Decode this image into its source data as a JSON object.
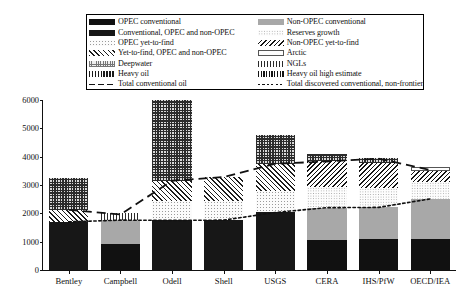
{
  "legend": {
    "left_column": [
      {
        "label": "OPEC conventional",
        "pattern": "p-opecconv"
      },
      {
        "label": "Conventional, OPEC and non-OPEC",
        "pattern": "p-convboth"
      },
      {
        "label": "OPEC yet-to-find",
        "pattern": "p-opecytf"
      },
      {
        "label": "Yet-to-find, OPEC and non-OPEC",
        "pattern": "p-ytfboth"
      },
      {
        "label": "Deepwater",
        "pattern": "p-deepwater"
      },
      {
        "label": "Heavy oil",
        "pattern": "p-heavyoil"
      },
      {
        "label": "Total conventional oil",
        "pattern": "sw-dash"
      }
    ],
    "right_column": [
      {
        "label": "Non-OPEC conventional",
        "pattern": "p-nonopecconv"
      },
      {
        "label": "Reserves growth",
        "pattern": "p-resgrowth"
      },
      {
        "label": "Non-OPEC yet-to-find",
        "pattern": "p-nonopecytf"
      },
      {
        "label": "Arctic",
        "pattern": "p-arctic"
      },
      {
        "label": "NGLs",
        "pattern": "p-ngls"
      },
      {
        "label": "Heavy oil high estimate",
        "pattern": "p-heavyhigh"
      },
      {
        "label": "Total discovered conventional, non-frontier",
        "pattern": "sw-dot"
      }
    ]
  },
  "chart_data": {
    "type": "bar",
    "title": "",
    "xlabel": "",
    "ylabel": "",
    "ylim": [
      0,
      6000
    ],
    "yticks": [
      0,
      1000,
      2000,
      3000,
      4000,
      5000,
      6000
    ],
    "grid": false,
    "stacked": true,
    "legend_position": "top",
    "categories": [
      "Bentley",
      "Campbell",
      "Odell",
      "Shell",
      "USGS",
      "CERA",
      "IHS/PfW",
      "OECD/IEA"
    ],
    "totals": [
      3230,
      2020,
      6000,
      3280,
      4750,
      4100,
      3950,
      3650
    ],
    "series": [
      {
        "name": "Conventional, OPEC and non-OPEC",
        "pattern": "p-convboth",
        "values": [
          1700,
          0,
          1750,
          1760,
          2030,
          0,
          0,
          0
        ]
      },
      {
        "name": "OPEC conventional",
        "pattern": "p-opecconv",
        "values": [
          0,
          930,
          0,
          0,
          0,
          1070,
          1080,
          1090
        ]
      },
      {
        "name": "Non-OPEC conventional",
        "pattern": "p-nonopecconv",
        "values": [
          0,
          830,
          0,
          0,
          0,
          1130,
          1130,
          1420
        ]
      },
      {
        "name": "OPEC yet-to-find",
        "pattern": "p-opecytf",
        "values": [
          0,
          0,
          700,
          680,
          760,
          0,
          0,
          0
        ]
      },
      {
        "name": "Reserves growth",
        "pattern": "p-resgrowth",
        "values": [
          0,
          0,
          0,
          0,
          0,
          730,
          700,
          600
        ]
      },
      {
        "name": "Yet-to-find, OPEC and non-OPEC",
        "pattern": "p-ytfboth",
        "values": [
          420,
          0,
          700,
          840,
          960,
          0,
          0,
          0
        ]
      },
      {
        "name": "Non-OPEC yet-to-find",
        "pattern": "p-nonopecytf",
        "values": [
          0,
          0,
          0,
          0,
          0,
          930,
          860,
          400
        ]
      },
      {
        "name": "Arctic",
        "pattern": "p-arctic",
        "values": [
          0,
          0,
          0,
          0,
          0,
          0,
          0,
          140
        ]
      },
      {
        "name": "NGLs",
        "pattern": "p-ngls",
        "values": [
          0,
          260,
          0,
          0,
          0,
          0,
          0,
          0
        ]
      },
      {
        "name": "Deepwater / other unconventional",
        "pattern": "p-checkdark",
        "values": [
          1110,
          0,
          2850,
          0,
          1000,
          240,
          180,
          0
        ]
      }
    ],
    "lines": [
      {
        "name": "Total conventional oil",
        "style": "dashed",
        "values": [
          2120,
          1960,
          3150,
          3280,
          3750,
          3830,
          3930,
          3530
        ]
      },
      {
        "name": "Total discovered conventional, non-frontier",
        "style": "dotted",
        "values": [
          1700,
          1760,
          1750,
          1760,
          2030,
          2200,
          2210,
          2510
        ]
      }
    ]
  }
}
